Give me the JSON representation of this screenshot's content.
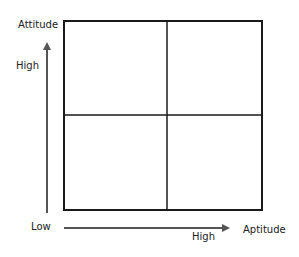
{
  "diagram": {
    "type": "2x2 matrix",
    "y_axis": {
      "title": "Attitude",
      "high_label": "High"
    },
    "x_axis": {
      "title": "Aptitude",
      "high_label": "High",
      "origin_label": "Low"
    },
    "quadrants": [
      {
        "position": "top-left",
        "label": ""
      },
      {
        "position": "top-right",
        "label": ""
      },
      {
        "position": "bottom-left",
        "label": ""
      },
      {
        "position": "bottom-right",
        "label": ""
      }
    ],
    "colors": {
      "line": "#1a1a1a",
      "arrow": "#555555",
      "text": "#222222",
      "background": "#ffffff"
    }
  }
}
